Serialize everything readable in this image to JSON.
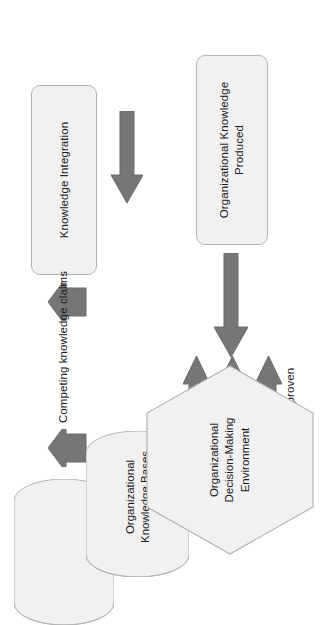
{
  "diagram": {
    "orientation": "rotated-90-ccw",
    "colors": {
      "shape_fill": "#f1f1f1",
      "shape_stroke": "#b4b4b4",
      "arrow_fill": "#767676",
      "arrow_stroke": "#6b6b6b",
      "text": "#1b1b1b",
      "background": "#ffffff"
    },
    "nodes": {
      "knowledge_integration": {
        "label": "Knowledge Integration",
        "shape": "rounded-rectangle"
      },
      "knowledge_bases": {
        "label_line1": "Organizational",
        "label_line2": "Knowledge Bases",
        "shape": "cylinder-stack"
      },
      "decision_environment": {
        "label_line1": "Organizational",
        "label_line2": "Decision-Making",
        "label_line3": "Environment",
        "shape": "hexagon"
      },
      "knowledge_produced": {
        "label_line1": "Organizational Knowledge",
        "label_line2": "Produced",
        "shape": "rounded-rectangle"
      }
    },
    "edges": {
      "competing_claims": {
        "label": "Competing knowledge claims"
      },
      "outcomes": [
        {
          "label": "Proven"
        },
        {
          "label": "Refuted"
        },
        {
          "label": "Not proven"
        }
      ],
      "produced_to_integration": {
        "label": ""
      },
      "environment_to_produced": {
        "label": ""
      }
    }
  }
}
